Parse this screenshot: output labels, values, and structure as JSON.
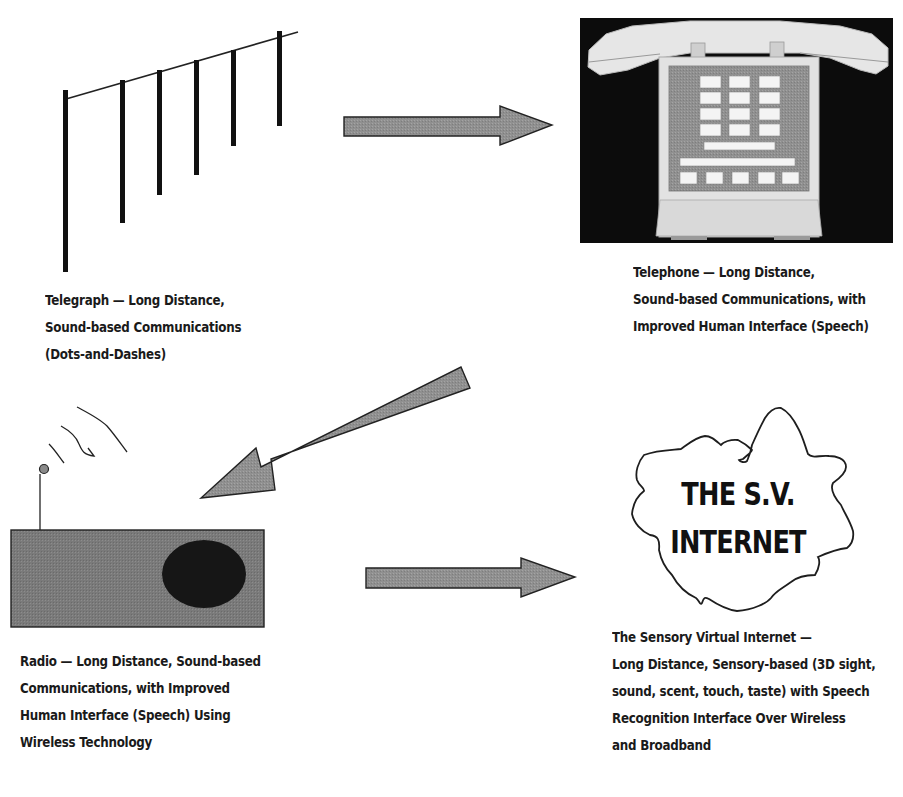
{
  "figure": {
    "colors": {
      "ink": "#111111",
      "arrow_fill": "#8f8f8f",
      "radio_body": "#7a7a7a",
      "radio_speaker": "#151515",
      "phone_background": "#0c0c0c",
      "phone_body": "#e4e4e4",
      "phone_panel": "#8a8a8a",
      "phone_keys": "#f2f2f2"
    }
  },
  "nodes": [
    {
      "id": "telegraph",
      "icon": "telegraph-poles-icon",
      "caption_lines": [
        "Telegraph — Long  Distance,",
        "Sound-based Communications",
        "(Dots-and-Dashes)"
      ]
    },
    {
      "id": "telephone",
      "icon": "telephone-icon",
      "caption_lines": [
        "Telephone — Long  Distance,",
        "Sound-based  Communications, with",
        "Improved Human Interface  (Speech)"
      ]
    },
    {
      "id": "radio",
      "icon": "radio-icon",
      "caption_lines": [
        "Radio — Long  Distance, Sound-based",
        "Communications, with Improved",
        "Human  Interface  (Speech) Using",
        "Wireless Technology"
      ]
    },
    {
      "id": "sv-internet",
      "icon": "cloud-icon",
      "cloud_label_lines": [
        "THE S.V.",
        "INTERNET"
      ],
      "caption_lines": [
        "The Sensory  Virtual  Internet —",
        "Long  Distance, Sensory-based  (3D sight,",
        "sound, scent,  touch, taste)  with Speech",
        "Recognition  Interface Over Wireless",
        "and Broadband"
      ]
    }
  ],
  "edges": [
    {
      "from": "telegraph",
      "to": "telephone",
      "direction": "right"
    },
    {
      "from": "telephone",
      "to": "radio",
      "direction": "down-left"
    },
    {
      "from": "radio",
      "to": "sv-internet",
      "direction": "right"
    }
  ]
}
